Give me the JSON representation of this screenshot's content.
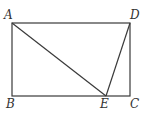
{
  "diagram": {
    "type": "geometry",
    "stroke_color": "#3a3a3a",
    "points": {
      "A": {
        "label": "A",
        "x": 12,
        "y": 23
      },
      "D": {
        "label": "D",
        "x": 130,
        "y": 23
      },
      "B": {
        "label": "B",
        "x": 12,
        "y": 96
      },
      "C": {
        "label": "C",
        "x": 130,
        "y": 96
      },
      "E": {
        "label": "E",
        "x": 106,
        "y": 96
      }
    },
    "segments": [
      "AD",
      "AB",
      "BC",
      "CD",
      "AE",
      "DE"
    ]
  }
}
